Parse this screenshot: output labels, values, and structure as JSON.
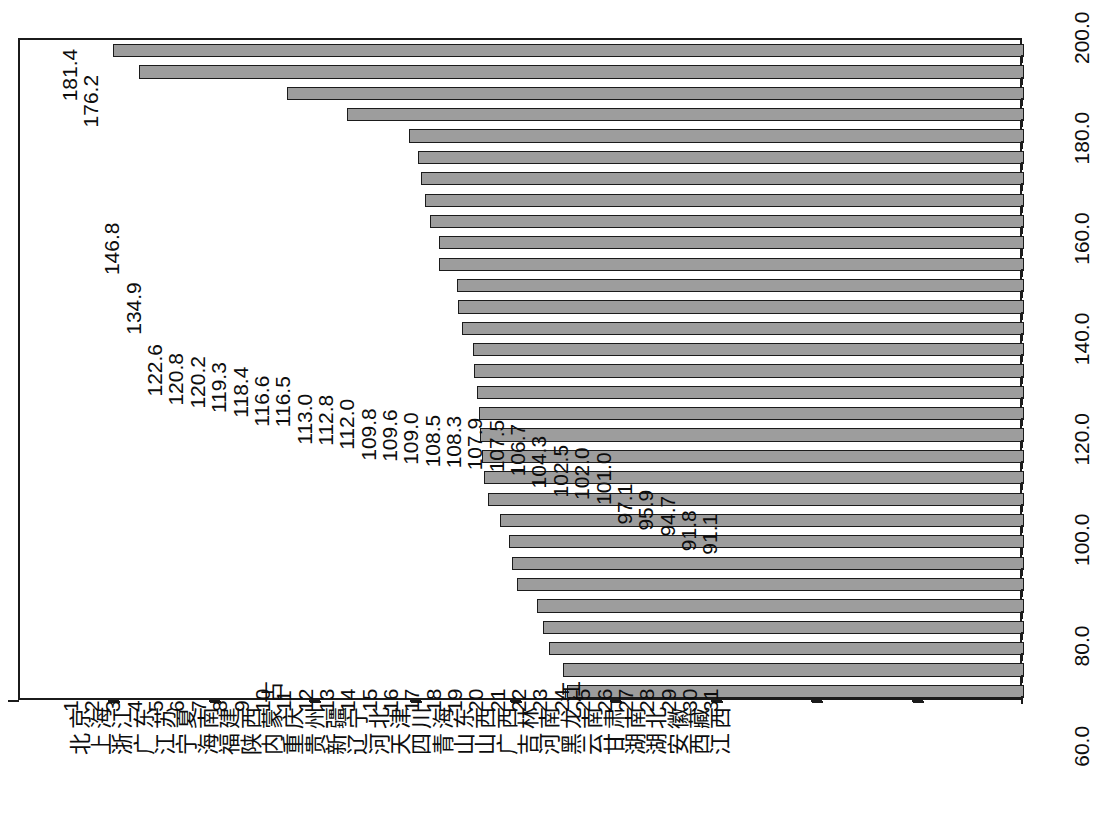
{
  "chart": {
    "orientation": "rotated-90",
    "bar_fill_color": "#9d9d9d",
    "bar_border_color": "#1b1b1b",
    "axis_color": "#1b1b1b",
    "background_color": "#ffffff"
  },
  "chart_data": {
    "type": "bar",
    "title": "",
    "subtitle": "",
    "xlabel": "",
    "ylabel": "",
    "ylim": [
      0,
      200
    ],
    "grid": false,
    "legend": null,
    "annotations": [],
    "tick_labels": [
      "0",
      "20.0",
      "40.0",
      "60.0",
      "80.0",
      "100.0",
      "120.0",
      "140.0",
      "160.0",
      "180.0",
      "200.0"
    ],
    "ticks": [
      0,
      20,
      40,
      60,
      80,
      100,
      120,
      140,
      160,
      180,
      200
    ],
    "ranks": [
      "1",
      "2",
      "3",
      "4",
      "5",
      "6",
      "7",
      "8",
      "9",
      "10",
      "11",
      "12",
      "13",
      "14",
      "15",
      "16",
      "17",
      "18",
      "19",
      "20",
      "21",
      "22",
      "23",
      "24",
      "25",
      "26",
      "27",
      "28",
      "29",
      "30",
      "31"
    ],
    "categories": [
      "北京",
      "上海",
      "浙江",
      "广东",
      "江苏",
      "宁夏",
      "海南",
      "福建",
      "陕西",
      "内蒙古",
      "重庆",
      "贵州",
      "新疆",
      "辽宁",
      "河北",
      "天津",
      "四川",
      "青海",
      "山东",
      "山西",
      "广西",
      "吉林",
      "河南",
      "黑龙江",
      "云南",
      "甘肃",
      "湖南",
      "湖北",
      "安徽",
      "西藏",
      "江西"
    ],
    "values": [
      181.4,
      176.2,
      146.8,
      134.9,
      122.6,
      120.8,
      120.2,
      119.3,
      118.4,
      116.6,
      116.5,
      113.0,
      112.8,
      112.0,
      109.8,
      109.6,
      109.0,
      108.5,
      108.3,
      107.9,
      107.5,
      106.7,
      104.3,
      102.5,
      102.0,
      101.0,
      97.1,
      95.9,
      94.7,
      91.8,
      91.1
    ],
    "value_labels": [
      "181.4",
      "176.2",
      "146.8",
      "134.9",
      "122.6",
      "120.8",
      "120.2",
      "119.3",
      "118.4",
      "116.6",
      "116.5",
      "113.0",
      "112.8",
      "112.0",
      "109.8",
      "109.6",
      "109.0",
      "108.5",
      "108.3",
      "107.9",
      "107.5",
      "106.7",
      "104.3",
      "102.5",
      "102.0",
      "101.0",
      "97.1",
      "95.9",
      "94.7",
      "91.8",
      "91.1"
    ]
  }
}
